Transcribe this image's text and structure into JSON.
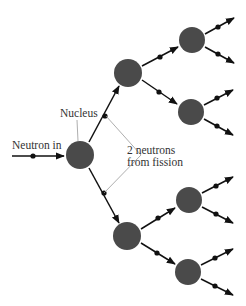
{
  "diagram": {
    "labels": {
      "neutron_in": "Neutron in",
      "nucleus": "Nucleus",
      "two_neutrons_line1": "2 neutrons",
      "two_neutrons_line2": "from fission"
    },
    "colors": {
      "nucleus_fill": "#4a4a4a",
      "arrow": "#111111",
      "leader_line": "#999999",
      "text": "#333333"
    },
    "nuclei": [
      {
        "id": "gen1",
        "cx": 80,
        "cy": 155,
        "r": 14
      },
      {
        "id": "gen2-upper",
        "cx": 128,
        "cy": 73,
        "r": 14
      },
      {
        "id": "gen2-lower",
        "cx": 127,
        "cy": 236,
        "r": 14
      },
      {
        "id": "gen3-1",
        "cx": 192,
        "cy": 40,
        "r": 13
      },
      {
        "id": "gen3-2",
        "cx": 191,
        "cy": 112,
        "r": 13
      },
      {
        "id": "gen3-3",
        "cx": 189,
        "cy": 200,
        "r": 13
      },
      {
        "id": "gen3-4",
        "cx": 188,
        "cy": 272,
        "r": 13
      }
    ]
  }
}
